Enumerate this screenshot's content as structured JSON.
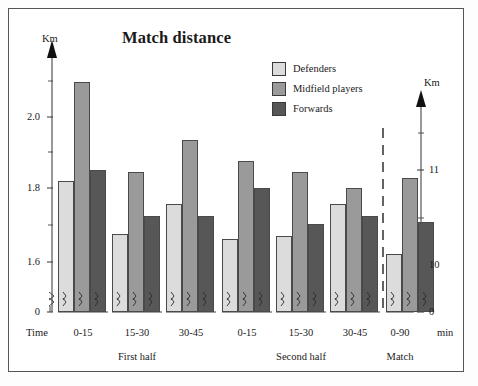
{
  "chart_data": {
    "type": "bar",
    "title": "Match distance",
    "xlabel": "Time",
    "xunit": "min",
    "ylabel": "Km",
    "ylabel_right": "Km",
    "categories": [
      "0-15",
      "15-30",
      "30-45",
      "0-15",
      "15-30",
      "30-45",
      "0-90"
    ],
    "sections": [
      "First half",
      "Second half",
      "Match"
    ],
    "series": [
      {
        "name": "Defenders",
        "color": "#dcdcdc",
        "values": [
          1.82,
          1.67,
          1.755,
          1.655,
          1.665,
          1.755,
          10.12
        ]
      },
      {
        "name": "Midfield players",
        "color": "#9a9a9a",
        "values": [
          2.1,
          1.845,
          1.935,
          1.875,
          1.845,
          1.8,
          10.92
        ]
      },
      {
        "name": "Forwards",
        "color": "#575757",
        "values": [
          1.85,
          1.72,
          1.72,
          1.8,
          1.7,
          1.72,
          10.45
        ]
      }
    ],
    "yticks_left": [
      "2.0",
      "1.8",
      "1.6",
      "0"
    ],
    "yticks_right": [
      "11",
      "10",
      "0"
    ],
    "ylim_left": [
      1.52,
      2.165
    ],
    "ylim_right": [
      9.76,
      11.28
    ],
    "axis_break": true,
    "grid": false,
    "legend_position": "top-right"
  },
  "axes": {
    "left_unit": "Km",
    "right_unit": "Km",
    "time_label": "Time",
    "min_label": "min"
  },
  "legend": {
    "items": [
      {
        "label": "Defenders"
      },
      {
        "label": "Midfield players"
      },
      {
        "label": "Forwards"
      }
    ]
  },
  "ticks": {
    "left": [
      {
        "text": "2.0"
      },
      {
        "text": "1.8"
      },
      {
        "text": "1.6"
      },
      {
        "text": "0"
      }
    ],
    "right": [
      {
        "text": "11"
      },
      {
        "text": "10"
      },
      {
        "text": "0"
      }
    ]
  },
  "groups": [
    {
      "label": "0-15"
    },
    {
      "label": "15-30"
    },
    {
      "label": "30-45"
    },
    {
      "label": "0-15"
    },
    {
      "label": "15-30"
    },
    {
      "label": "30-45"
    },
    {
      "label": "0-90"
    }
  ],
  "sections": [
    {
      "label": "First half"
    },
    {
      "label": "Second half"
    },
    {
      "label": "Match"
    }
  ],
  "title": "Match distance"
}
